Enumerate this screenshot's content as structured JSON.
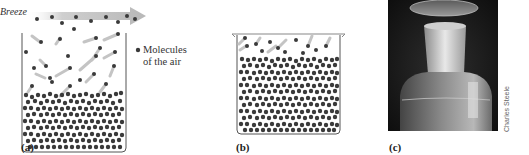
{
  "panels": [
    {
      "id": "a",
      "label": "(a)",
      "breeze_label": "Breeze",
      "legend": {
        "line1": "Molecules",
        "line2": "of the air"
      },
      "description": "Open beaker with breeze carrying vapor molecules away"
    },
    {
      "id": "b",
      "label": "(b)",
      "description": "Covered beaker with vapor molecules in equilibrium above liquid"
    },
    {
      "id": "c",
      "label": "(c)",
      "credit": "Charles Steele",
      "description": "Photo of stoppered glass bottle containing liquid"
    }
  ],
  "colors": {
    "molecule": "#3a3a3a",
    "trail": "#bdbdbd",
    "beaker": "#555555",
    "breeze_arrow": "#c8c8c8",
    "photo_bg": "#1a1a1a"
  }
}
